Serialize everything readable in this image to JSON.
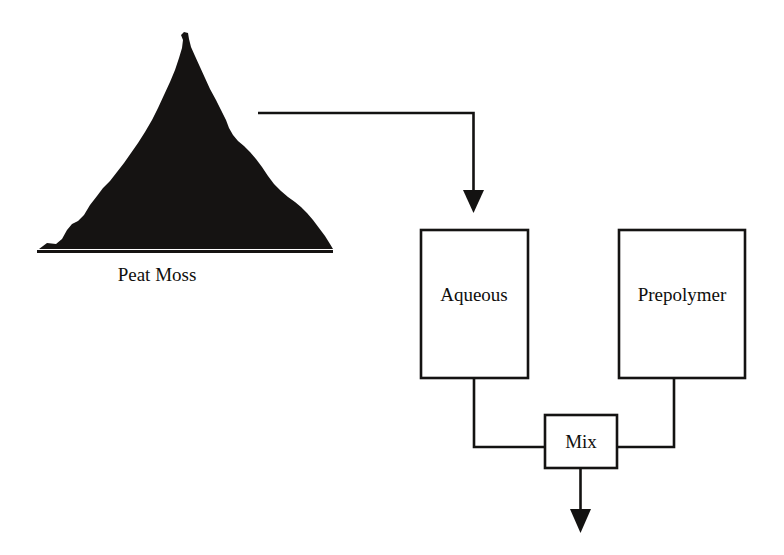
{
  "diagram": {
    "background_color": "#ffffff",
    "ink_color": "#131211",
    "nodes": [
      {
        "id": "peat-moss",
        "label": "Peat Moss",
        "shape": "pile",
        "label_position": "below"
      },
      {
        "id": "aqueous",
        "label": "Aqueous",
        "shape": "rectangle"
      },
      {
        "id": "prepolymer",
        "label": "Prepolymer",
        "shape": "rectangle"
      },
      {
        "id": "mix",
        "label": "Mix",
        "shape": "rectangle"
      }
    ],
    "edges": [
      {
        "id": "peat-to-aqueous",
        "from": "peat-moss",
        "to": "aqueous",
        "arrow": true,
        "routing": "orthogonal"
      },
      {
        "id": "aqueous-to-mix",
        "from": "aqueous",
        "to": "mix",
        "arrow": false,
        "routing": "orthogonal"
      },
      {
        "id": "prepolymer-to-mix",
        "from": "prepolymer",
        "to": "mix",
        "arrow": false,
        "routing": "orthogonal"
      },
      {
        "id": "mix-output",
        "from": "mix",
        "to": "",
        "arrow": true,
        "routing": "straight-down"
      }
    ]
  }
}
